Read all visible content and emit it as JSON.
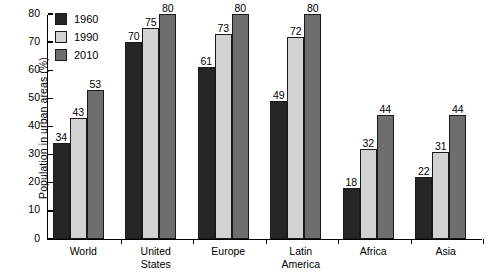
{
  "chart_data": {
    "type": "bar",
    "title": "",
    "xlabel": "",
    "ylabel": "Population in urban areas (%)",
    "ylim": [
      0,
      80
    ],
    "yticks": [
      0,
      10,
      20,
      30,
      40,
      50,
      60,
      70,
      80
    ],
    "grid": false,
    "legend_position": "top-left",
    "categories": [
      "World",
      "United States",
      "Europe",
      "Latin America",
      "Africa",
      "Asia"
    ],
    "category_lines": [
      [
        "World"
      ],
      [
        "United",
        "States"
      ],
      [
        "Europe"
      ],
      [
        "Latin",
        "America"
      ],
      [
        "Africa"
      ],
      [
        "Asia"
      ]
    ],
    "series": [
      {
        "name": "1960",
        "color": "#262626",
        "values": [
          34,
          70,
          61,
          49,
          18,
          22
        ]
      },
      {
        "name": "1990",
        "color": "#d2d2d2",
        "values": [
          43,
          75,
          73,
          72,
          32,
          31
        ]
      },
      {
        "name": "2010",
        "color": "#6e6e6e",
        "values": [
          53,
          80,
          80,
          80,
          44,
          44
        ]
      }
    ]
  },
  "legend": {
    "items": [
      {
        "label": "1960"
      },
      {
        "label": "1990"
      },
      {
        "label": "2010"
      }
    ]
  },
  "axis": {
    "y_title": "Population in urban areas (%)"
  }
}
